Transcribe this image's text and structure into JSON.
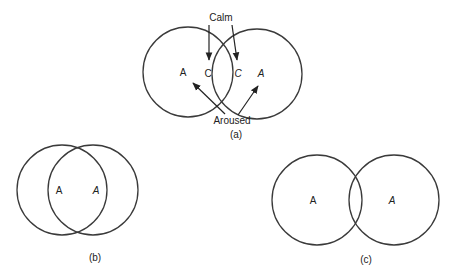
{
  "figure": {
    "panels": [
      {
        "id": "a",
        "caption": "(a)",
        "circles": [
          {
            "cx": 188,
            "cy": 72,
            "r": 45
          },
          {
            "cx": 257,
            "cy": 74,
            "r": 45
          }
        ],
        "labels": {
          "left_A": "A",
          "left_C": "C",
          "right_C": "C",
          "right_A": "A",
          "calm": "Calm",
          "aroused": "Aroused"
        }
      },
      {
        "id": "b",
        "caption": "(b)",
        "circles": [
          {
            "cx": 62,
            "cy": 190,
            "r": 45
          },
          {
            "cx": 93,
            "cy": 190,
            "r": 45
          }
        ],
        "labels": {
          "left_A": "A",
          "right_A": "A"
        }
      },
      {
        "id": "c",
        "caption": "(c)",
        "circles": [
          {
            "cx": 317,
            "cy": 200,
            "r": 45
          },
          {
            "cx": 394,
            "cy": 200,
            "r": 45
          }
        ],
        "labels": {
          "left_A": "A",
          "right_A": "A"
        }
      }
    ],
    "colors": {
      "stroke": "#3a3a3a",
      "text": "#222222",
      "background": "#ffffff"
    }
  }
}
